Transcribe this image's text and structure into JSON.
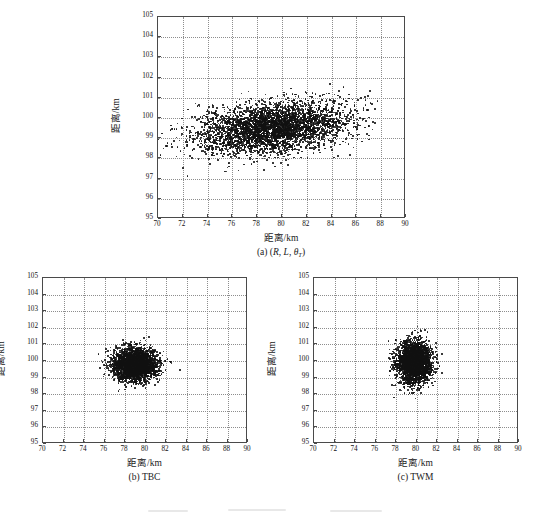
{
  "figure": {
    "axis_title_x": "距离/km",
    "axis_title_y": "距离/km",
    "xticks": [
      "70",
      "72",
      "74",
      "76",
      "78",
      "80",
      "82",
      "84",
      "86",
      "88",
      "90"
    ],
    "yticks": [
      "95",
      "96",
      "97",
      "98",
      "99",
      "100",
      "101",
      "102",
      "103",
      "104",
      "105"
    ],
    "dot_color": "#111111",
    "grid_color": "#8d8d8d",
    "frame_color": "#4a4a4a"
  },
  "chart_data": [
    {
      "id": "panel-a",
      "type": "scatter",
      "title": "",
      "caption_prefix": "(a)",
      "caption_open": "(",
      "caption_r": "R",
      "caption_sep1": ", ",
      "caption_l": "L",
      "caption_sep2": ", ",
      "caption_theta": "θ",
      "caption_theta_sub": "T",
      "caption_close": ")",
      "caption_plain": "(a) (R, L, θT)",
      "xlabel": "距离/km",
      "ylabel": "距离/km",
      "xlim": [
        70,
        90
      ],
      "ylim": [
        95,
        105
      ],
      "xticks": [
        70,
        72,
        74,
        76,
        78,
        80,
        82,
        84,
        86,
        88,
        90
      ],
      "yticks": [
        95,
        96,
        97,
        98,
        99,
        100,
        101,
        102,
        103,
        104,
        105
      ],
      "grid": true,
      "n_points": 4000,
      "cluster": {
        "x_mean": 79.2,
        "y_mean": 99.5,
        "x_sigma": 3.0,
        "y_sigma": 0.62,
        "correlation": 0.3,
        "x_range": [
          70.0,
          88.4
        ],
        "y_range": [
          96.9,
          101.9
        ],
        "shape": "elongated-horizontal-ellipse"
      }
    },
    {
      "id": "panel-b",
      "type": "scatter",
      "title": "",
      "caption_plain": "(b) TBC",
      "caption_prefix": "(b)",
      "caption_name": "TBC",
      "xlabel": "距离/km",
      "ylabel": "距离/km",
      "xlim": [
        70,
        90
      ],
      "ylim": [
        95,
        105
      ],
      "xticks": [
        70,
        72,
        74,
        76,
        78,
        80,
        82,
        84,
        86,
        88,
        90
      ],
      "yticks": [
        95,
        96,
        97,
        98,
        99,
        100,
        101,
        102,
        103,
        104,
        105
      ],
      "grid": true,
      "n_points": 3000,
      "cluster": {
        "x_mean": 79.0,
        "y_mean": 99.8,
        "x_sigma": 1.05,
        "y_sigma": 0.47,
        "correlation": 0.0,
        "x_range": [
          75.3,
          83.6
        ],
        "y_range": [
          97.9,
          101.6
        ],
        "shape": "compact-ellipse"
      }
    },
    {
      "id": "panel-c",
      "type": "scatter",
      "title": "",
      "caption_plain": "(c) TWM",
      "caption_prefix": "(c)",
      "caption_name": "TWM",
      "xlabel": "距离/km",
      "ylabel": "距离/km",
      "xlim": [
        70,
        90
      ],
      "ylim": [
        95,
        105
      ],
      "xticks": [
        70,
        72,
        74,
        76,
        78,
        80,
        82,
        84,
        86,
        88,
        90
      ],
      "yticks": [
        95,
        96,
        97,
        98,
        99,
        100,
        101,
        102,
        103,
        104,
        105
      ],
      "grid": true,
      "n_points": 3000,
      "cluster": {
        "x_mean": 79.8,
        "y_mean": 99.9,
        "x_sigma": 0.82,
        "y_sigma": 0.62,
        "correlation": 0.0,
        "x_range": [
          77.2,
          82.7
        ],
        "y_range": [
          97.6,
          102.1
        ],
        "shape": "compact-circle"
      }
    }
  ],
  "layout": {
    "panels": [
      {
        "id": "panel-a",
        "plot_left": 157,
        "plot_top": 16,
        "plot_w": 248,
        "plot_h": 202,
        "caption_top": 247
      },
      {
        "id": "panel-b",
        "plot_left": 42,
        "plot_top": 277,
        "plot_w": 205,
        "plot_h": 166,
        "caption_top": 472
      },
      {
        "id": "panel-c",
        "plot_left": 313,
        "plot_top": 277,
        "plot_w": 205,
        "plot_h": 166,
        "caption_top": 472
      }
    ]
  }
}
